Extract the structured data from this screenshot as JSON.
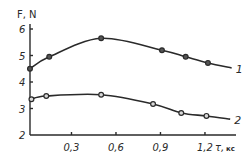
{
  "chart_data": {
    "type": "line",
    "title": "",
    "xlabel": "τ, кс",
    "ylabel": "F, N",
    "xlim": [
      0,
      1.4
    ],
    "ylim": [
      2,
      6.2
    ],
    "x_ticks": [
      0.3,
      0.6,
      0.9,
      1.2
    ],
    "x_tick_labels": [
      "0,3",
      "0,6",
      "0,9",
      "1,2"
    ],
    "y_ticks": [
      2,
      3,
      4,
      5,
      6
    ],
    "y_tick_labels": [
      "2",
      "3",
      "4",
      "5",
      "6"
    ],
    "grid": false,
    "legend_position": "inline-right",
    "series": [
      {
        "name": "1",
        "marker": "filled-circle",
        "x": [
          0.02,
          0.15,
          0.5,
          0.91,
          1.07,
          1.22
        ],
        "y": [
          4.5,
          4.95,
          5.65,
          5.2,
          4.95,
          4.72
        ],
        "curve_end": [
          1.38,
          4.53
        ]
      },
      {
        "name": "2",
        "marker": "open-circle",
        "x": [
          0.03,
          0.13,
          0.5,
          0.85,
          1.04,
          1.21
        ],
        "y": [
          3.35,
          3.47,
          3.52,
          3.17,
          2.83,
          2.72
        ],
        "curve_end": [
          1.37,
          2.6
        ]
      }
    ]
  }
}
